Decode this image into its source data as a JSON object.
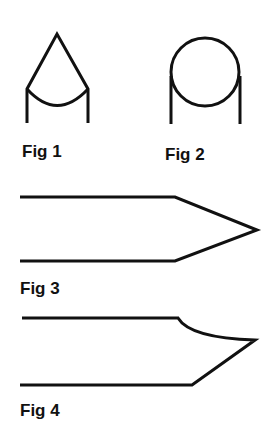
{
  "figures": [
    {
      "id": "fig1",
      "label": "Fig 1",
      "shape": "conical point with concave base arc"
    },
    {
      "id": "fig2",
      "label": "Fig 2",
      "shape": "round (circular) point"
    },
    {
      "id": "fig3",
      "label": "Fig 3",
      "shape": "symmetric chisel point"
    },
    {
      "id": "fig4",
      "label": "Fig 4",
      "shape": "asymmetric curved chisel point"
    }
  ],
  "colors": {
    "stroke": "#111111",
    "background": "#ffffff"
  }
}
